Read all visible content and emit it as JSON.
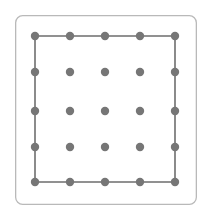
{
  "figure": {
    "name": "geoboard",
    "caption": "",
    "width": 211,
    "height": 217,
    "background_color": "#ffffff"
  },
  "board_frame": {
    "name": "board-outline",
    "x": 15,
    "y": 15,
    "width": 182,
    "height": 190,
    "corner_radius": 7,
    "stroke_color": "#b9b9b9",
    "stroke_width": 1.3,
    "fill_color": "#ffffff"
  },
  "grid": {
    "rows": 5,
    "cols": 5,
    "dot_color": "#767676",
    "dot_radius": 4.2,
    "col_x": [
      35,
      70,
      105,
      140,
      175
    ],
    "row_y": [
      36,
      72,
      111,
      147,
      182
    ],
    "pegs": [
      {
        "row": 0,
        "col": 0,
        "cx": 35,
        "cy": 36,
        "on_shape": true
      },
      {
        "row": 0,
        "col": 1,
        "cx": 70,
        "cy": 36,
        "on_shape": true
      },
      {
        "row": 0,
        "col": 2,
        "cx": 105,
        "cy": 36,
        "on_shape": true
      },
      {
        "row": 0,
        "col": 3,
        "cx": 140,
        "cy": 36,
        "on_shape": true
      },
      {
        "row": 0,
        "col": 4,
        "cx": 175,
        "cy": 36,
        "on_shape": true
      },
      {
        "row": 1,
        "col": 0,
        "cx": 35,
        "cy": 72,
        "on_shape": true
      },
      {
        "row": 1,
        "col": 1,
        "cx": 70,
        "cy": 72,
        "on_shape": false
      },
      {
        "row": 1,
        "col": 2,
        "cx": 105,
        "cy": 72,
        "on_shape": false
      },
      {
        "row": 1,
        "col": 3,
        "cx": 140,
        "cy": 72,
        "on_shape": false
      },
      {
        "row": 1,
        "col": 4,
        "cx": 175,
        "cy": 72,
        "on_shape": true
      },
      {
        "row": 2,
        "col": 0,
        "cx": 35,
        "cy": 111,
        "on_shape": true
      },
      {
        "row": 2,
        "col": 1,
        "cx": 70,
        "cy": 111,
        "on_shape": false
      },
      {
        "row": 2,
        "col": 2,
        "cx": 105,
        "cy": 111,
        "on_shape": false
      },
      {
        "row": 2,
        "col": 3,
        "cx": 140,
        "cy": 111,
        "on_shape": false
      },
      {
        "row": 2,
        "col": 4,
        "cx": 175,
        "cy": 111,
        "on_shape": true
      },
      {
        "row": 3,
        "col": 0,
        "cx": 35,
        "cy": 147,
        "on_shape": true
      },
      {
        "row": 3,
        "col": 1,
        "cx": 70,
        "cy": 147,
        "on_shape": false
      },
      {
        "row": 3,
        "col": 2,
        "cx": 105,
        "cy": 147,
        "on_shape": false
      },
      {
        "row": 3,
        "col": 3,
        "cx": 140,
        "cy": 147,
        "on_shape": false
      },
      {
        "row": 3,
        "col": 4,
        "cx": 175,
        "cy": 147,
        "on_shape": true
      },
      {
        "row": 4,
        "col": 0,
        "cx": 35,
        "cy": 182,
        "on_shape": true
      },
      {
        "row": 4,
        "col": 1,
        "cx": 70,
        "cy": 182,
        "on_shape": true
      },
      {
        "row": 4,
        "col": 2,
        "cx": 105,
        "cy": 182,
        "on_shape": true
      },
      {
        "row": 4,
        "col": 3,
        "cx": 140,
        "cy": 182,
        "on_shape": true
      },
      {
        "row": 4,
        "col": 4,
        "cx": 175,
        "cy": 182,
        "on_shape": true
      }
    ]
  },
  "shape": {
    "name": "rubber-band-square",
    "type": "square",
    "stroke_color": "#6e6e6e",
    "stroke_width": 1.6,
    "fill_color": "none",
    "vertices": [
      {
        "cx": 35,
        "cy": 36
      },
      {
        "cx": 175,
        "cy": 36
      },
      {
        "cx": 175,
        "cy": 182
      },
      {
        "cx": 35,
        "cy": 182
      }
    ],
    "points_attr": "35,36 175,36 175,182 35,182"
  }
}
